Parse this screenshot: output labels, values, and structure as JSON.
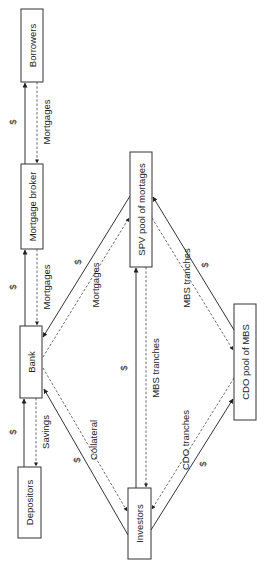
{
  "diagram": {
    "nodes": {
      "borrowers": "Borrowers",
      "mortgage_broker": "Mortgage broker",
      "bank": "Bank",
      "depositors": "Depositors",
      "spv": "SPV pool of mortages",
      "cdo": "CDO pool of MBS",
      "investors": "Investors"
    },
    "edges": {
      "broker_borrowers_money": "$",
      "borrowers_broker_flow": "Mortgages",
      "bank_broker_money": "$",
      "broker_bank_flow": "Mortgages",
      "depositors_bank_money": "$",
      "bank_depositors_flow": "Savings",
      "spv_bank_money": "$",
      "bank_spv_flow": "Mortgages",
      "investors_bank_money": "$",
      "bank_investors_flow": "Collateral",
      "investors_spv_money": "$",
      "spv_investors_flow": "MBS tranches",
      "cdo_spv_money": "$",
      "spv_cdo_flow": "MBS tranches",
      "investors_cdo_money": "$",
      "cdo_investors_flow": "CDO tranches"
    }
  }
}
